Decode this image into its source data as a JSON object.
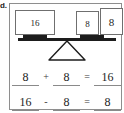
{
  "item": {
    "letter": "d."
  },
  "balance": {
    "left_pan": {
      "cards": [
        {
          "value": "16"
        }
      ]
    },
    "right_pan": {
      "cards": [
        {
          "value": "8"
        },
        {
          "value": "8"
        }
      ]
    },
    "fulcrum_icon": "triangle-fulcrum-icon",
    "beam_icon": "balance-beam-icon"
  },
  "equations": [
    {
      "terms": [
        {
          "type": "blank",
          "value": "8"
        },
        {
          "type": "operator",
          "value": "+"
        },
        {
          "type": "blank",
          "value": "8"
        },
        {
          "type": "operator",
          "value": "="
        },
        {
          "type": "blank",
          "value": "16"
        }
      ]
    },
    {
      "terms": [
        {
          "type": "blank",
          "value": "16"
        },
        {
          "type": "operator",
          "value": "-"
        },
        {
          "type": "blank",
          "value": "8"
        },
        {
          "type": "operator",
          "value": "="
        },
        {
          "type": "blank",
          "value": "8"
        }
      ]
    }
  ],
  "colors": {
    "frame_border": "#8e8e8e",
    "card_border": "#6f6f6f",
    "beam": "#1d1d1d",
    "text": "#242424",
    "blank_rule": "#8a8a8a",
    "background": "#ffffff"
  }
}
